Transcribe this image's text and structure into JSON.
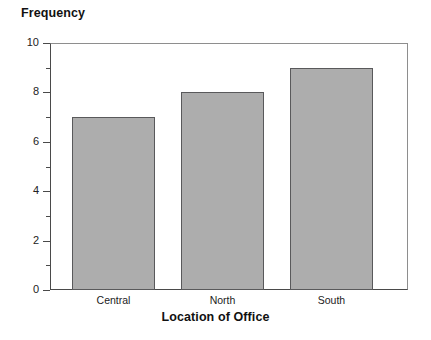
{
  "chart_data": {
    "type": "bar",
    "title": "",
    "categories": [
      "Central",
      "North",
      "South"
    ],
    "values": [
      7,
      8,
      9
    ],
    "series": [
      {
        "name": "Frequency",
        "values": [
          7,
          8,
          9
        ]
      }
    ],
    "xlabel": "Location of Office",
    "ylabel": "Frequency",
    "ylim": [
      0,
      10
    ],
    "y_major_ticks": [
      0,
      2,
      4,
      6,
      8,
      10
    ],
    "y_minor_ticks": [
      1,
      3,
      5,
      7,
      9
    ],
    "y_tick_labels": [
      "0",
      "2",
      "4",
      "6",
      "8",
      "10"
    ],
    "grid": false,
    "legend": false,
    "legend_position": "none",
    "bar_fill_color": "#adadad",
    "bar_border_color": "#59595b",
    "plot_background_color": "#ffffff",
    "axis_color": "#4a4a4a",
    "frame_color": "#8e8e8e",
    "text_color": "#111111"
  },
  "axes": {
    "y_title": "Frequency",
    "x_title": "Location of Office"
  }
}
